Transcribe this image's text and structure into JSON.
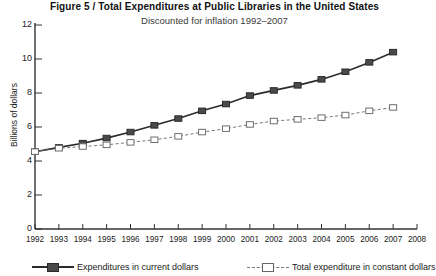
{
  "figure": {
    "number_label": "Figure 5",
    "separator": "/",
    "title": "Figure 5  /  Total Expenditures at Public Libraries in the United States",
    "subtitle": "Discounted for inflation 1992–2007"
  },
  "chart_data": {
    "type": "line",
    "title": "Figure 5  /  Total Expenditures at Public Libraries in the United States",
    "subtitle": "Discounted for inflation 1992–2007",
    "xlabel": "",
    "ylabel": "Billions of dollars",
    "xlim": [
      1992,
      2008
    ],
    "ylim": [
      0,
      12
    ],
    "ytick_labels": [
      "0",
      "2",
      "4",
      "6",
      "8",
      "10",
      "12"
    ],
    "yticks": [
      0,
      2,
      4,
      6,
      8,
      10,
      12
    ],
    "xtick_labels": [
      "1992",
      "1993",
      "1994",
      "1995",
      "1996",
      "1997",
      "1998",
      "1999",
      "2000",
      "2001",
      "2002",
      "2003",
      "2004",
      "2005",
      "2006",
      "2007",
      "2008"
    ],
    "xticks": [
      1992,
      1993,
      1994,
      1995,
      1996,
      1997,
      1998,
      1999,
      2000,
      2001,
      2002,
      2003,
      2004,
      2005,
      2006,
      2007,
      2008
    ],
    "x": [
      1992,
      1993,
      1994,
      1995,
      1996,
      1997,
      1998,
      1999,
      2000,
      2001,
      2002,
      2003,
      2004,
      2005,
      2006,
      2007
    ],
    "grid": false,
    "legend_position": "bottom",
    "series": [
      {
        "name": "Expenditures in current dollars",
        "style": "solid",
        "marker": "filled-square",
        "color": "#2b2b2b",
        "values": [
          4.55,
          4.8,
          5.05,
          5.35,
          5.7,
          6.1,
          6.5,
          6.95,
          7.35,
          7.85,
          8.15,
          8.45,
          8.8,
          9.25,
          9.8,
          10.4
        ]
      },
      {
        "name": "Total expenditure in constant dollars",
        "style": "dashed",
        "marker": "open-square",
        "color": "#777777",
        "values": [
          4.55,
          4.75,
          4.85,
          4.95,
          5.1,
          5.25,
          5.45,
          5.7,
          5.9,
          6.15,
          6.35,
          6.45,
          6.55,
          6.7,
          6.95,
          7.15
        ]
      }
    ]
  },
  "legend": {
    "items": [
      {
        "label": "Expenditures in current dollars",
        "style": "solid"
      },
      {
        "label": "Total expenditure in constant dollars",
        "style": "dashed"
      }
    ]
  },
  "colors": {
    "series_current": "#2b2b2b",
    "series_constant": "#777777",
    "axis": "#333333",
    "text": "#1a1a1a"
  }
}
